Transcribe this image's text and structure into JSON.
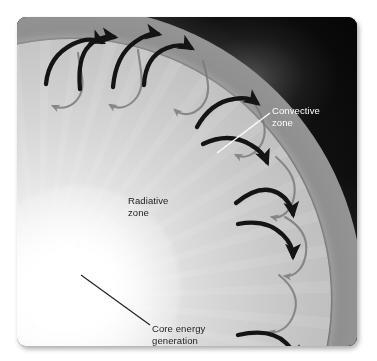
{
  "figure": {
    "background_color": "#0a0a0a",
    "frame": {
      "corner_radius_px": 9,
      "x": 17,
      "y": 17,
      "width": 340,
      "height": 329
    }
  },
  "labels": {
    "convective_zone": "Convective\nzone",
    "radiative_zone": "Radiative\nzone",
    "core_energy": "Core energy\ngeneration"
  },
  "label_colors": {
    "convective_zone": "#ffffff",
    "radiative_zone": "#1d1d1d",
    "core_energy": "#1d1d1d"
  },
  "leader_lines": {
    "convective_zone": {
      "from_x": 253,
      "from_y": 96,
      "to_x": 200,
      "to_y": 136,
      "color": "#ffffff"
    },
    "core_energy": {
      "from_x": 133,
      "from_y": 308,
      "to_x": 64,
      "to_y": 258,
      "color": "#1d1d1d"
    }
  },
  "zones": {
    "core": {
      "name": "Core",
      "color": "#ffffff"
    },
    "radiative": {
      "name": "Radiative zone",
      "color": "#cfcfcf"
    },
    "convective": {
      "name": "Convective zone",
      "color": "#9a9a9a"
    },
    "photosphere_glow": {
      "name": "Photosphere glow",
      "color": "#f0f0f0"
    },
    "space": {
      "name": "Space",
      "color": "#080808"
    }
  },
  "arrows": {
    "rising_color": "#141414",
    "returning_color": "#7b7b7b",
    "rising_count": 8,
    "returning_count": 7,
    "description": "Convection cells: thick dark arrows rise outward through the convective zone, thin gray arrows sink back inward."
  }
}
